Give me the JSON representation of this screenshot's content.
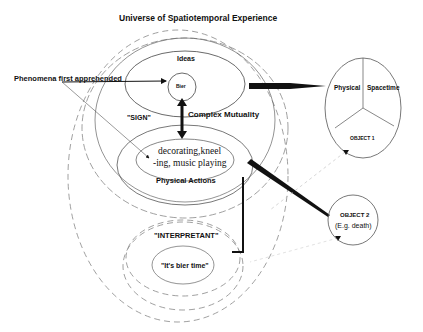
{
  "title": "Universe of Spatiotemporal Experience",
  "left_label": "Phenomena first apprehended",
  "ideas": {
    "label": "Ideas",
    "inner": "Bier"
  },
  "sign_label": "\"SIGN\"",
  "mutuality_label": "Complex Mutuality",
  "physical_actions": {
    "inner_line1": "decorating,kneel",
    "inner_line2": "-ing, music playing",
    "label": "Physical Actions"
  },
  "interpretant": {
    "label": "\"INTERPRETANT\"",
    "inner": "\"It's bier time\""
  },
  "object1": {
    "left_label": "Physical",
    "right_label": "Spacetime",
    "bottom_label": "OBJECT 1"
  },
  "object2": {
    "line1": "OBJECT 2",
    "line2": "(E.g. death)"
  },
  "colors": {
    "ink": "#111111",
    "faint": "#888888",
    "background": "#ffffff"
  }
}
